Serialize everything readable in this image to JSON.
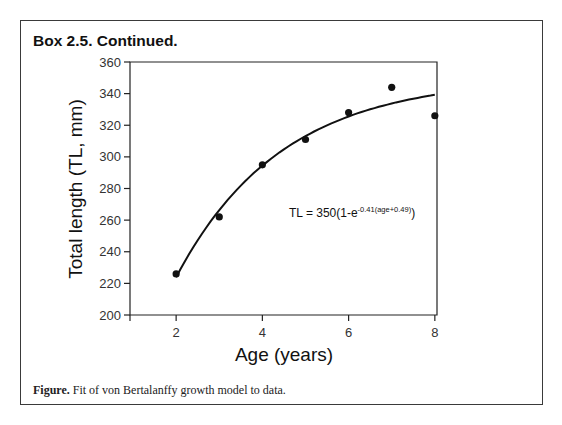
{
  "box": {
    "title": "Box 2.5. Continued."
  },
  "caption": {
    "label": "Figure.",
    "text": " Fit of von Bertalanffy growth model to data."
  },
  "equation": {
    "main": "TL = 350(1-e",
    "exponent": "-0.41(age+0.49)",
    "close": ")"
  },
  "chart_data": {
    "type": "scatter",
    "title": "",
    "xlabel": "Age (years)",
    "ylabel": "Total length (TL, mm)",
    "xlim": [
      0.93,
      8.05
    ],
    "ylim": [
      200,
      360
    ],
    "x_ticks": [
      2,
      4,
      6,
      8
    ],
    "y_ticks": [
      200,
      220,
      240,
      260,
      280,
      300,
      320,
      340,
      360
    ],
    "grid": false,
    "legend": null,
    "series": [
      {
        "name": "Observed",
        "kind": "points",
        "x": [
          2,
          3,
          4,
          5,
          6,
          7,
          8
        ],
        "y": [
          226,
          262,
          295,
          311,
          328,
          344,
          326
        ]
      },
      {
        "name": "von Bertalanffy fit",
        "kind": "line",
        "formula": "TL = 350(1-e^(-0.41(age+0.49)))",
        "Linf": 350,
        "K": 0.41,
        "t0": -0.49,
        "x_range": [
          2,
          8
        ]
      }
    ],
    "annotations": [
      {
        "text": "TL = 350(1-e^-0.41(age+0.49))",
        "x": 5.9,
        "y": 266
      }
    ]
  }
}
